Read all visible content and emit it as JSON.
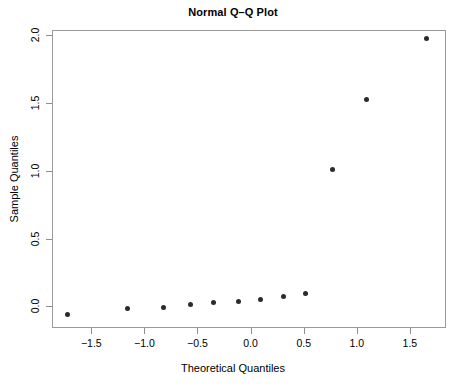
{
  "chart_data": {
    "type": "scatter",
    "title": "Normal Q–Q Plot",
    "xlabel": "Theoretical Quantiles",
    "ylabel": "Sample Quantiles",
    "xlim": [
      -1.87,
      1.84
    ],
    "ylim": [
      -0.16,
      2.04
    ],
    "grid": false,
    "legend": null,
    "xticks": [
      -1.5,
      -1.0,
      -0.5,
      0.0,
      0.5,
      1.0,
      1.5
    ],
    "xtick_labels": [
      "−1.5",
      "−1.0",
      "−0.5",
      "0.0",
      "0.5",
      "1.0",
      "1.5"
    ],
    "yticks": [
      0.0,
      0.5,
      1.0,
      1.5,
      2.0
    ],
    "ytick_labels": [
      "0.0",
      "0.5",
      "1.0",
      "1.5",
      "2.0"
    ],
    "series": [
      {
        "name": "Sample Quantiles",
        "marker": "filled-circle",
        "color": "#2b2b2b",
        "points": [
          {
            "x": -1.72,
            "y": -0.06
          },
          {
            "x": -1.16,
            "y": -0.015
          },
          {
            "x": -0.82,
            "y": -0.007
          },
          {
            "x": -0.57,
            "y": 0.015
          },
          {
            "x": -0.35,
            "y": 0.03
          },
          {
            "x": -0.11,
            "y": 0.037
          },
          {
            "x": 0.09,
            "y": 0.052
          },
          {
            "x": 0.31,
            "y": 0.074
          },
          {
            "x": 0.52,
            "y": 0.096
          },
          {
            "x": 0.77,
            "y": 1.01
          },
          {
            "x": 1.09,
            "y": 1.53
          },
          {
            "x": 1.66,
            "y": 1.98
          }
        ]
      }
    ]
  },
  "style": {
    "frame_color": "#9a9a9a",
    "point_color": "#2b2b2b",
    "background": "#ffffff",
    "text_color": "#000000"
  }
}
